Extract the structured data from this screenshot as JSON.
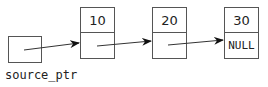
{
  "source": {
    "label": "source_ptr"
  },
  "nodes": [
    {
      "value": "10",
      "next": ""
    },
    {
      "value": "20",
      "next": ""
    },
    {
      "value": "30",
      "next": "NULL"
    }
  ],
  "colors": {
    "stroke": "#555555",
    "text": "#222222",
    "arrow": "#111111"
  }
}
